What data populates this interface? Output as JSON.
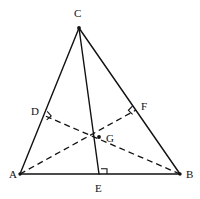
{
  "figure": {
    "background_color": "#ffffff",
    "line_color": "#111111",
    "canvas": {
      "width": 200,
      "height": 199
    }
  },
  "labels": {
    "A": "A",
    "B": "B",
    "C": "C",
    "D": "D",
    "E": "E",
    "F": "F",
    "G": "G"
  },
  "points": {
    "A": {
      "name": "A",
      "x": 20,
      "y": 174,
      "label_x": 9,
      "label_y": 178
    },
    "B": {
      "name": "B",
      "x": 180,
      "y": 174,
      "label_x": 186,
      "label_y": 178
    },
    "C": {
      "name": "C",
      "x": 79,
      "y": 28,
      "label_x": 74,
      "label_y": 17
    },
    "D": {
      "name": "D",
      "x": 43,
      "y": 115,
      "label_x": 31,
      "label_y": 115
    },
    "E": {
      "name": "E",
      "x": 99,
      "y": 174,
      "label_x": 95,
      "label_y": 192
    },
    "F": {
      "name": "F",
      "x": 136,
      "y": 110,
      "label_x": 141,
      "label_y": 110
    },
    "G": {
      "name": "G",
      "x": 99,
      "y": 137,
      "label_x": 106,
      "label_y": 142
    }
  },
  "segments": {
    "side_AB": {
      "name": "AB",
      "from": "A",
      "to": "B",
      "style": "solid"
    },
    "side_AC": {
      "name": "AC",
      "from": "A",
      "to": "C",
      "style": "solid"
    },
    "side_CB": {
      "name": "CB",
      "from": "C",
      "to": "B",
      "style": "solid"
    },
    "altitude_CE": {
      "name": "CE",
      "from": "C",
      "to": "E",
      "style": "solid"
    },
    "altitude_AF": {
      "name": "AF",
      "from": "A",
      "to": "F",
      "style": "dashed"
    },
    "altitude_BD": {
      "name": "BD",
      "from": "B",
      "to": "D",
      "style": "dashed"
    }
  },
  "right_angles": [
    {
      "at": "D",
      "path": "M 47.2 111.4 L 51.2 115.9 L 46.7 119.9"
    },
    {
      "at": "E",
      "path": "M 101.0 168.8 L 107.0 168.8 L 107.0 174.0"
    },
    {
      "at": "F",
      "path": "M 132.4 106.1 L 128.4 110.3 L 132.6 114.3"
    }
  ]
}
